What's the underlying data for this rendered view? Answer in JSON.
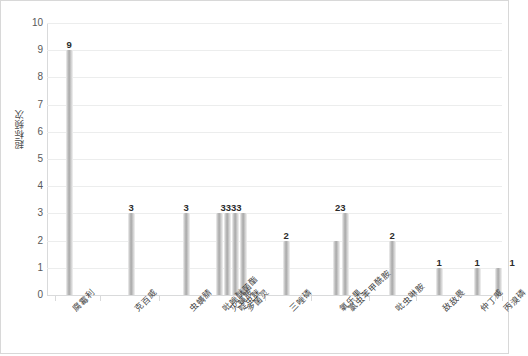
{
  "chart_data": {
    "type": "bar",
    "title": "",
    "xlabel": "",
    "ylabel": "超标频次",
    "ylim": [
      0,
      10
    ],
    "ytick_values": [
      10,
      9,
      8,
      7,
      6,
      5,
      4,
      3,
      2,
      1,
      0
    ],
    "grid": true,
    "legend": "none",
    "categories": [
      "腐霉利",
      "克百威",
      "虫螨腈",
      "吡唑醚菌酯",
      "灭蝇胺",
      "啶虫脒",
      "多菌灵",
      "三唑磷",
      "氧乐果",
      "氯虫苯甲酰胺",
      "吡虫啉胺",
      "敌敌畏",
      "仲丁威",
      "丙溴磷"
    ],
    "values": [
      9,
      3,
      3,
      3,
      3,
      3,
      3,
      2,
      2,
      3,
      2,
      1,
      1,
      1
    ],
    "bar_value_labels": [
      "9",
      "3",
      "3",
      "3",
      "3",
      "3",
      "3",
      "2",
      "2",
      "3",
      "2",
      "1",
      "1",
      "1"
    ],
    "colors": {
      "bar_light": "#f2f2f2",
      "bar_mid": "#a8a8a8",
      "gridline": "#eceded",
      "axis": "#d9dadb",
      "tick_text": "#595959",
      "label_text": "#2b2b2b",
      "border": "#d8d8d8"
    }
  }
}
